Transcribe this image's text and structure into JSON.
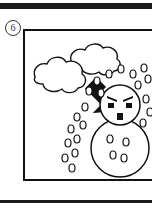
{
  "page": {
    "width": 152,
    "height": 214,
    "background_color": "#ffffff",
    "ink_color": "#111111",
    "rule_color": "#1a1a1a"
  },
  "step": {
    "number": "6",
    "badge_shape": "circle"
  },
  "panel": {
    "border_color": "#111111",
    "fill_color": "#ffffff",
    "cropped_edge": "right"
  },
  "illustration": {
    "title": "Hailstorm striking an angry snowman",
    "style": "black-and-white line art",
    "elements": [
      {
        "name": "cloud",
        "label": "storm cloud",
        "description": "two overlapping scalloped cloud puffs",
        "fill": "#ffffff",
        "stroke": "#111111"
      },
      {
        "name": "arrow",
        "label": "direction arrow",
        "description": "solid black arrow pointing down and to the right",
        "fill": "#111111",
        "direction": "down-right"
      },
      {
        "name": "snowman",
        "label": "angry snowman",
        "description": "round head on a larger round body",
        "fill": "#ffffff",
        "stroke": "#111111",
        "expression": "angry"
      },
      {
        "name": "hail",
        "label": "falling hailstones",
        "description": "scattered small open ovals falling diagonally",
        "fill": "#ffffff",
        "stroke": "#111111",
        "count": 22
      }
    ],
    "face": {
      "eyebrows": "angled inward, angry",
      "eyes": "two small filled rectangles",
      "mouth": "one small filled vertical rectangle"
    }
  }
}
